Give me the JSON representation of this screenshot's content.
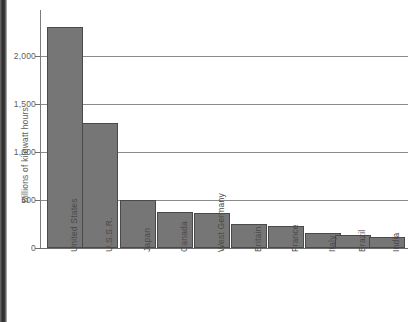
{
  "chart_data": {
    "type": "bar",
    "title": "",
    "subtitle": "",
    "xlabel": "",
    "ylabel": "Billions of kilowatt hours",
    "categories": [
      "United States",
      "U.S.S.R.",
      "Japan",
      "Canada",
      "West Germany",
      "Britain",
      "France",
      "Italy",
      "Brazil",
      "India"
    ],
    "values": [
      2300,
      1300,
      500,
      375,
      360,
      250,
      230,
      160,
      140,
      110
    ],
    "ylim": [
      0,
      2450
    ],
    "yticks": [
      0,
      500,
      1000,
      1500,
      2000
    ],
    "ytick_labels": [
      "0",
      "500",
      "1,000",
      "1,500",
      "2,000"
    ],
    "grid": true,
    "legend": "none",
    "series": [
      {
        "name": "Electricity production",
        "values": [
          2300,
          1300,
          500,
          375,
          360,
          250,
          230,
          160,
          140,
          110
        ]
      }
    ],
    "colors": {
      "bar_fill": "#767676",
      "bar_stroke": "#4a4a4a",
      "gridline": "#8a8a8a",
      "axis": "#6d6d6d",
      "text": "#5d5d5d",
      "background": "#ffffff"
    }
  },
  "axis": {
    "y": {
      "labels": [
        {
          "text": "2,000",
          "value": 2000
        },
        {
          "text": "1,500",
          "value": 1500
        },
        {
          "text": "1,000",
          "value": 1000
        },
        {
          "text": "500",
          "value": 500
        },
        {
          "text": "0",
          "value": 0
        }
      ],
      "title": "Billions of kilowatt hours"
    },
    "x": {
      "labels": [
        {
          "text": "United States"
        },
        {
          "text": "U.S.S.R."
        },
        {
          "text": "Japan"
        },
        {
          "text": "Canada"
        },
        {
          "text": "West Germany"
        },
        {
          "text": "Britain"
        },
        {
          "text": "France"
        },
        {
          "text": "Italy"
        },
        {
          "text": "Brazil"
        },
        {
          "text": "India"
        }
      ]
    }
  }
}
